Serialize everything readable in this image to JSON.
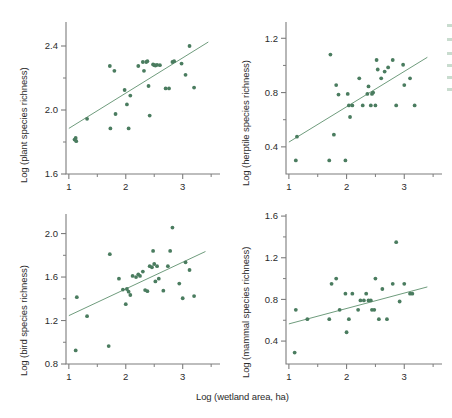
{
  "figure": {
    "background": "#ffffff",
    "marker_color": "#4a7c5f",
    "line_color": "#6f9c7d",
    "axis_color": "#7d7d7d",
    "text_color": "#2b2b2b",
    "shared_xlabel": "Log (wetland area, ha)"
  },
  "chart_data": [
    {
      "id": "plant",
      "type": "scatter",
      "title": "",
      "xlabel": "Log (wetland area, ha)",
      "ylabel": "Log (plant species richness)",
      "xlim": [
        0.95,
        3.55
      ],
      "ylim": [
        1.6,
        2.55
      ],
      "xticks": [
        1,
        2,
        3
      ],
      "xticklabels": [
        "1",
        "2",
        "3"
      ],
      "xminorticks": [
        1.5,
        2.5,
        3.5
      ],
      "yticks": [
        1.6,
        2.0,
        2.4
      ],
      "yticklabels": [
        "1.6",
        "2.0",
        "2.4"
      ],
      "yminorticks": [
        1.8,
        2.2
      ],
      "grid": false,
      "legend": "none",
      "regression": {
        "x": [
          1.0,
          3.45
        ],
        "y": [
          1.885,
          2.425
        ]
      },
      "points": [
        [
          1.1,
          1.815
        ],
        [
          1.12,
          1.825
        ],
        [
          1.13,
          1.805
        ],
        [
          1.32,
          1.945
        ],
        [
          1.72,
          2.275
        ],
        [
          1.73,
          1.885
        ],
        [
          1.8,
          2.245
        ],
        [
          1.82,
          1.975
        ],
        [
          1.98,
          2.125
        ],
        [
          2.02,
          2.035
        ],
        [
          2.05,
          1.885
        ],
        [
          2.08,
          2.09
        ],
        [
          2.22,
          2.275
        ],
        [
          2.3,
          2.3
        ],
        [
          2.32,
          2.245
        ],
        [
          2.36,
          2.3
        ],
        [
          2.38,
          2.305
        ],
        [
          2.4,
          2.15
        ],
        [
          2.42,
          1.965
        ],
        [
          2.48,
          2.285
        ],
        [
          2.5,
          2.28
        ],
        [
          2.52,
          2.278
        ],
        [
          2.55,
          2.282
        ],
        [
          2.6,
          2.28
        ],
        [
          2.7,
          2.135
        ],
        [
          2.76,
          2.135
        ],
        [
          2.82,
          2.3
        ],
        [
          2.85,
          2.305
        ],
        [
          2.98,
          2.29
        ],
        [
          3.05,
          2.22
        ],
        [
          3.12,
          2.4
        ],
        [
          3.2,
          2.14
        ]
      ]
    },
    {
      "id": "herptile",
      "type": "scatter",
      "title": "",
      "xlabel": "Log (wetland area, ha)",
      "ylabel": "Log (herptile species richness)",
      "xlim": [
        0.95,
        3.55
      ],
      "ylim": [
        0.2,
        1.32
      ],
      "xticks": [
        1,
        2,
        3
      ],
      "xticklabels": [
        "1",
        "2",
        "3"
      ],
      "xminorticks": [
        1.5,
        2.5,
        3.5
      ],
      "yticks": [
        0.4,
        0.8,
        1.2
      ],
      "yticklabels": [
        "0.4",
        "0.8",
        "1.2"
      ],
      "yminorticks": [
        0.6,
        1.0
      ],
      "grid": false,
      "legend": "none",
      "regression": {
        "x": [
          1.0,
          3.4
        ],
        "y": [
          0.435,
          1.06
        ]
      },
      "points": [
        [
          1.12,
          0.3
        ],
        [
          1.14,
          0.475
        ],
        [
          1.7,
          0.3
        ],
        [
          1.72,
          1.08
        ],
        [
          1.78,
          0.49
        ],
        [
          1.82,
          0.855
        ],
        [
          1.86,
          0.785
        ],
        [
          1.98,
          0.3
        ],
        [
          2.02,
          0.79
        ],
        [
          2.04,
          0.705
        ],
        [
          2.06,
          0.62
        ],
        [
          2.1,
          0.705
        ],
        [
          2.22,
          0.905
        ],
        [
          2.28,
          0.705
        ],
        [
          2.36,
          0.79
        ],
        [
          2.38,
          0.845
        ],
        [
          2.42,
          0.705
        ],
        [
          2.44,
          0.79
        ],
        [
          2.46,
          0.8
        ],
        [
          2.5,
          0.705
        ],
        [
          2.52,
          1.04
        ],
        [
          2.54,
          0.97
        ],
        [
          2.6,
          0.905
        ],
        [
          2.66,
          0.955
        ],
        [
          2.72,
          0.985
        ],
        [
          2.8,
          1.04
        ],
        [
          2.86,
          0.705
        ],
        [
          2.98,
          1.005
        ],
        [
          3.0,
          0.855
        ],
        [
          3.1,
          0.905
        ],
        [
          3.18,
          0.705
        ]
      ]
    },
    {
      "id": "bird",
      "type": "scatter",
      "title": "",
      "xlabel": "Log (wetland area, ha)",
      "ylabel": "Log (bird species richness)",
      "xlim": [
        0.95,
        3.55
      ],
      "ylim": [
        0.8,
        2.18
      ],
      "xticks": [
        1,
        2,
        3
      ],
      "xticklabels": [
        "1",
        "2",
        "3"
      ],
      "xminorticks": [
        1.5,
        2.5,
        3.5
      ],
      "yticks": [
        0.8,
        1.2,
        1.6,
        2.0
      ],
      "yticklabels": [
        "0.8",
        "1.2",
        "1.6",
        "2.0"
      ],
      "yminorticks": [
        1.0,
        1.4,
        1.8
      ],
      "grid": false,
      "legend": "none",
      "regression": {
        "x": [
          1.0,
          3.4
        ],
        "y": [
          1.245,
          1.835
        ]
      },
      "points": [
        [
          1.12,
          0.925
        ],
        [
          1.14,
          1.415
        ],
        [
          1.32,
          1.24
        ],
        [
          1.7,
          0.965
        ],
        [
          1.72,
          1.81
        ],
        [
          1.88,
          1.585
        ],
        [
          1.95,
          1.485
        ],
        [
          2.0,
          1.35
        ],
        [
          2.02,
          1.49
        ],
        [
          2.05,
          1.465
        ],
        [
          2.08,
          1.435
        ],
        [
          2.12,
          1.61
        ],
        [
          2.18,
          1.6
        ],
        [
          2.22,
          1.625
        ],
        [
          2.25,
          1.61
        ],
        [
          2.3,
          1.65
        ],
        [
          2.34,
          1.48
        ],
        [
          2.38,
          1.47
        ],
        [
          2.42,
          1.7
        ],
        [
          2.46,
          1.69
        ],
        [
          2.48,
          1.84
        ],
        [
          2.5,
          1.72
        ],
        [
          2.52,
          1.56
        ],
        [
          2.55,
          1.7
        ],
        [
          2.58,
          1.585
        ],
        [
          2.66,
          1.475
        ],
        [
          2.74,
          1.7
        ],
        [
          2.78,
          1.84
        ],
        [
          2.82,
          2.055
        ],
        [
          2.94,
          1.54
        ],
        [
          3.0,
          1.405
        ],
        [
          3.05,
          1.735
        ],
        [
          3.12,
          1.665
        ],
        [
          3.2,
          1.425
        ]
      ]
    },
    {
      "id": "mammal",
      "type": "scatter",
      "title": "",
      "xlabel": "Log (wetland area, ha)",
      "ylabel": "Log (mammal species richness)",
      "xlim": [
        0.95,
        3.55
      ],
      "ylim": [
        0.18,
        1.62
      ],
      "xticks": [
        1,
        2,
        3
      ],
      "xticklabels": [
        "1",
        "2",
        "3"
      ],
      "xminorticks": [
        1.5,
        2.5,
        3.5
      ],
      "yticks": [
        0.4,
        0.8,
        1.2,
        1.6
      ],
      "yticklabels": [
        "0.4",
        "0.8",
        "1.2",
        "1.6"
      ],
      "yminorticks": [
        0.6,
        1.0,
        1.4
      ],
      "grid": false,
      "legend": "none",
      "regression": {
        "x": [
          1.0,
          3.4
        ],
        "y": [
          0.565,
          0.92
        ]
      },
      "points": [
        [
          1.1,
          0.29
        ],
        [
          1.12,
          0.7
        ],
        [
          1.32,
          0.61
        ],
        [
          1.7,
          0.61
        ],
        [
          1.74,
          0.95
        ],
        [
          1.82,
          1.0
        ],
        [
          1.88,
          0.7
        ],
        [
          1.98,
          0.855
        ],
        [
          2.0,
          0.485
        ],
        [
          2.04,
          0.61
        ],
        [
          2.1,
          0.855
        ],
        [
          2.2,
          0.7
        ],
        [
          2.24,
          0.79
        ],
        [
          2.3,
          0.79
        ],
        [
          2.34,
          0.855
        ],
        [
          2.38,
          0.79
        ],
        [
          2.42,
          0.79
        ],
        [
          2.44,
          0.7
        ],
        [
          2.48,
          0.7
        ],
        [
          2.5,
          1.0
        ],
        [
          2.56,
          0.61
        ],
        [
          2.62,
          0.9
        ],
        [
          2.7,
          0.61
        ],
        [
          2.8,
          0.95
        ],
        [
          2.86,
          1.35
        ],
        [
          2.92,
          0.78
        ],
        [
          3.0,
          0.95
        ],
        [
          3.1,
          0.855
        ],
        [
          3.14,
          0.855
        ]
      ]
    }
  ]
}
